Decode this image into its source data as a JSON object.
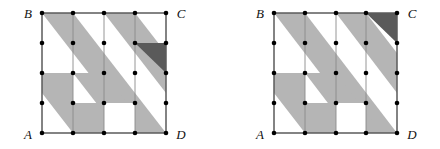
{
  "figure": {
    "caption": "",
    "colors": {
      "stripe_light": "#b5b5b5",
      "stripe_dark": "#5a5a5a",
      "grid_line": "#7a7a7a",
      "border_line": "#555555",
      "lattice_dot": "#000000",
      "background": "#ffffff"
    },
    "grid": {
      "columns": 4,
      "rows": 4,
      "lattice_points_per_side": 5
    },
    "panels": [
      {
        "id": "left",
        "name": "left-diagram",
        "labels": {
          "top_left": "B",
          "top_right": "C",
          "bottom_left": "A",
          "bottom_right": "D"
        },
        "dark_triangle_cell": "col3-row1",
        "dark_triangle_vertices": "top-left, top-right, bottom-right",
        "stripe_count": 3
      },
      {
        "id": "right",
        "name": "right-diagram",
        "labels": {
          "top_left": "B",
          "top_right": "C",
          "bottom_left": "A",
          "bottom_right": "D"
        },
        "dark_triangle_cell": "col3-row0",
        "dark_triangle_vertices": "top-left, top-right, bottom-right",
        "stripe_count": 3
      }
    ]
  }
}
